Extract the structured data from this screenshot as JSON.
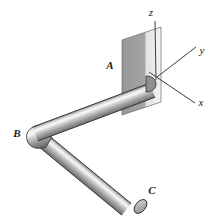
{
  "figure": {
    "background_color": "#ffffff",
    "outline_color": "#1a1a1a"
  },
  "axes": {
    "origin": {
      "x": 156,
      "y": 78
    },
    "items": [
      {
        "name": "z",
        "label": "z",
        "label_x": 151,
        "label_y": 16,
        "line": {
          "x1": 156,
          "y1": 78,
          "x2": 155,
          "y2": 20
        }
      },
      {
        "name": "y",
        "label": "y",
        "label_x": 200,
        "label_y": 54,
        "line": {
          "x1": 156,
          "y1": 78,
          "x2": 196,
          "y2": 47
        }
      },
      {
        "name": "x",
        "label": "x",
        "label_x": 199,
        "label_y": 105,
        "line": {
          "x1": 156,
          "y1": 78,
          "x2": 195,
          "y2": 104
        }
      }
    ]
  },
  "wall": {
    "name": "wall-plane",
    "points": "122,40 161,27 161,102 122,115",
    "fill_left": "#9a9a9a",
    "fill_right": "#efefef",
    "stroke": "#5a5a5a"
  },
  "pipe": {
    "name": "bent-pipe",
    "fill_light": "#fbfbfb",
    "fill_mid": "#b9b9b9",
    "fill_dark": "#6f6f6f",
    "stroke": "#2a2a2a",
    "radius": 7,
    "segments": [
      {
        "name": "segment-AB",
        "from": "A",
        "to": "B"
      },
      {
        "name": "segment-BC",
        "from": "B",
        "to": "C"
      }
    ]
  },
  "labels": {
    "A": {
      "text": "A",
      "x": 110,
      "y": 69
    },
    "B": {
      "text": "B",
      "x": 15,
      "y": 137
    },
    "C": {
      "text": "C",
      "x": 150,
      "y": 193
    }
  }
}
